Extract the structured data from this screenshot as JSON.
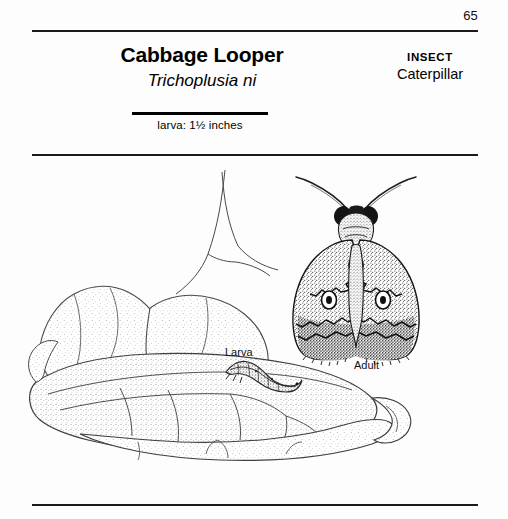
{
  "page": {
    "number": "65",
    "background_color": "#fdfdfd",
    "ink_color": "#000000"
  },
  "header": {
    "common_name": "Cabbage Looper",
    "scientific_name": "Trichoplusia ni",
    "category_kicker": "INSECT",
    "category_name": "Caterpillar"
  },
  "scale": {
    "label": "larva: 1½ inches"
  },
  "figures": {
    "larva_label": "Larva",
    "adult_label": "Adult"
  }
}
